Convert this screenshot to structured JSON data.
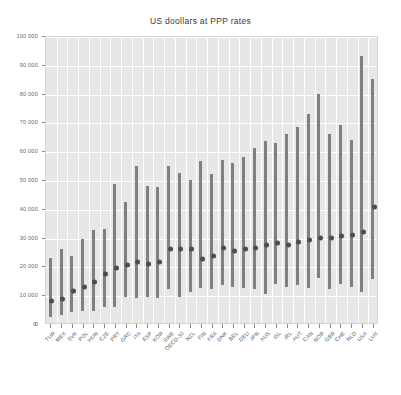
{
  "chart_data": {
    "type": "bar",
    "title": "US doollars at PPP rates",
    "xlabel": "",
    "ylabel": "",
    "ylim": [
      0,
      100000
    ],
    "ytick_values": [
      0,
      10000,
      20000,
      30000,
      40000,
      50000,
      60000,
      70000,
      80000,
      90000,
      100000
    ],
    "ytick_labels": [
      "0",
      "10 000",
      "20 000",
      "30 000",
      "40 000",
      "50 000",
      "60 000",
      "70 000",
      "80 000",
      "90 000",
      "100 000"
    ],
    "grid": true,
    "legend": "none",
    "categories": [
      "TUR",
      "MEX",
      "SVK",
      "POL",
      "HUN",
      "CZE",
      "PRT",
      "GRC",
      "ITA",
      "ESP",
      "KOR",
      "SWE",
      "OECD-30",
      "NZL",
      "FIN",
      "FRA",
      "DNK",
      "BEL",
      "DEU",
      "JPN",
      "AUS",
      "ISL",
      "IRL",
      "AUT",
      "CAN",
      "NOR",
      "GBR",
      "CHE",
      "NLD",
      "USA",
      "LUX"
    ],
    "series": [
      {
        "name": "Range (low to high)",
        "type": "range-bar",
        "low": [
          2500,
          3000,
          4000,
          4500,
          4500,
          6000,
          6000,
          9500,
          9000,
          9500,
          9000,
          12000,
          9500,
          11000,
          12500,
          12000,
          13500,
          13000,
          12500,
          12000,
          10500,
          14000,
          13000,
          13500,
          12500,
          16000,
          12000,
          14000,
          13000,
          11000,
          15500
        ],
        "high": [
          23000,
          26000,
          23500,
          29500,
          32500,
          33000,
          48500,
          42500,
          55000,
          48000,
          47500,
          55000,
          52500,
          50000,
          56500,
          52000,
          57000,
          56000,
          58000,
          61000,
          63500,
          63000,
          66000,
          68500,
          73000,
          80000,
          66000,
          69000,
          64000,
          93000,
          85000
        ]
      },
      {
        "name": "Median",
        "type": "point",
        "values": [
          8000,
          8800,
          11500,
          13000,
          14500,
          17500,
          19500,
          20500,
          21500,
          21000,
          21500,
          26000,
          26000,
          26000,
          22500,
          23500,
          26500,
          25500,
          26000,
          26500,
          27500,
          28000,
          27500,
          28500,
          29000,
          30000,
          30000,
          30500,
          31000,
          32000,
          40500
        ]
      }
    ]
  }
}
